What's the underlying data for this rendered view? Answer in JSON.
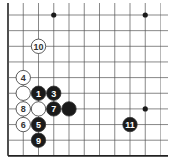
{
  "diagram": {
    "type": "go-board-fragment",
    "grid": {
      "columns": 11,
      "rows": 10,
      "origin_x": 8,
      "origin_y": 15,
      "spacing_x": 15.25,
      "spacing_y": 15.65,
      "left_edge": true,
      "bottom_edge": true,
      "line_color": "#555555",
      "edge_color": "#222222"
    },
    "star_points": [
      {
        "col": 3,
        "row": 0
      },
      {
        "col": 9,
        "row": 0
      },
      {
        "col": 9,
        "row": 6
      }
    ],
    "stones": [
      {
        "color": "black",
        "label": "1",
        "col": 2,
        "row": 5
      },
      {
        "color": "black",
        "label": "3",
        "col": 3,
        "row": 5
      },
      {
        "color": "white",
        "label": "4",
        "col": 1,
        "row": 4
      },
      {
        "color": "black",
        "label": "5",
        "col": 2,
        "row": 7
      },
      {
        "color": "white",
        "label": "6",
        "col": 1,
        "row": 7
      },
      {
        "color": "black",
        "label": "7",
        "col": 3,
        "row": 6
      },
      {
        "color": "white",
        "label": "8",
        "col": 1,
        "row": 6
      },
      {
        "color": "black",
        "label": "9",
        "col": 2,
        "row": 8
      },
      {
        "color": "white",
        "label": "10",
        "col": 2,
        "row": 2
      },
      {
        "color": "black",
        "label": "11",
        "col": 8,
        "row": 7
      },
      {
        "color": "white",
        "label": "",
        "col": 1,
        "row": 5
      },
      {
        "color": "white",
        "label": "",
        "col": 2,
        "row": 6
      },
      {
        "color": "black",
        "label": "",
        "col": 4,
        "row": 6
      }
    ],
    "colors": {
      "black_stone": "#1a1a1a",
      "white_stone": "#ffffff",
      "stone_outline": "#333333",
      "black_label": "#ffffff",
      "white_label": "#333333"
    }
  }
}
